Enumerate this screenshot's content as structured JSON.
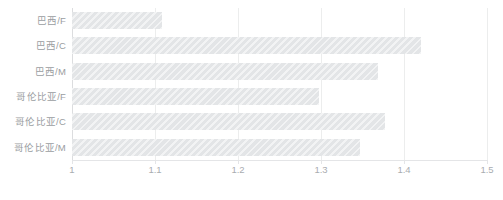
{
  "chart_data": {
    "type": "bar",
    "orientation": "horizontal",
    "title": "",
    "xlabel": "",
    "ylabel": "",
    "categories": [
      "巴西/F",
      "巴西/C",
      "巴西/M",
      "哥伦比亚/F",
      "哥伦比亚/C",
      "哥伦比亚/M"
    ],
    "values": [
      1.108,
      1.421,
      1.369,
      1.298,
      1.377,
      1.347
    ],
    "xlim": [
      1,
      1.5
    ],
    "xticks": [
      1,
      1.1,
      1.2,
      1.3,
      1.4,
      1.5
    ],
    "xtick_labels": [
      "1",
      "1.1",
      "1.2",
      "1.3",
      "1.4",
      "1.5"
    ],
    "grid": true,
    "legend": false,
    "bar_color": "#e3e5e7",
    "gridline_color": "#eceded",
    "text_color": "#9a9da1"
  }
}
